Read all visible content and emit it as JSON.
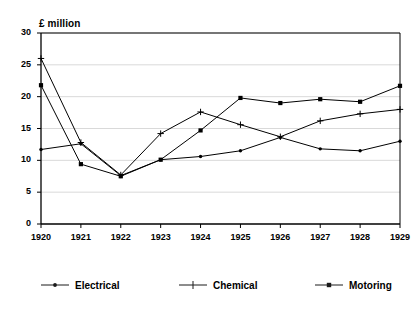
{
  "chart_data": {
    "type": "line",
    "title": "",
    "ylabel": "£ million",
    "xlabel": "",
    "categories": [
      "1920",
      "1921",
      "1922",
      "1923",
      "1924",
      "1925",
      "1926",
      "1927",
      "1928",
      "1929"
    ],
    "ylim": [
      0,
      30
    ],
    "yticks": [
      0,
      5,
      10,
      15,
      20,
      25,
      30
    ],
    "ytick_labels": [
      "0",
      "5",
      "10",
      "15",
      "20",
      "25",
      "30"
    ],
    "grid": "horizontal",
    "legend_position": "bottom",
    "series": [
      {
        "name": "Electrical",
        "marker": "dot",
        "color": "#000000",
        "values": [
          11.7,
          12.6,
          7.6,
          10.1,
          10.6,
          11.5,
          13.6,
          11.8,
          11.5,
          13.0
        ]
      },
      {
        "name": "Chemical",
        "marker": "plus",
        "color": "#000000",
        "values": [
          26.0,
          12.8,
          7.7,
          14.2,
          17.6,
          15.6,
          13.7,
          16.2,
          17.3,
          18.0
        ]
      },
      {
        "name": "Motoring",
        "marker": "square",
        "color": "#000000",
        "values": [
          21.8,
          9.4,
          7.5,
          10.1,
          14.7,
          19.8,
          19.0,
          19.6,
          19.2,
          21.7
        ]
      }
    ]
  },
  "axis": {
    "y_title": "£ million"
  },
  "legend": {
    "items": [
      {
        "label": "Electrical",
        "marker": "dot"
      },
      {
        "label": "Chemical",
        "marker": "plus"
      },
      {
        "label": "Motoring",
        "marker": "square"
      }
    ]
  },
  "style": {
    "axis_color": "#000000",
    "grid_color": "#d9d9d9",
    "line_color": "#1a1a1a",
    "background": "#ffffff"
  }
}
